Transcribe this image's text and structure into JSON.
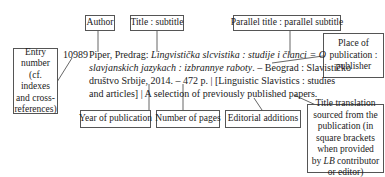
{
  "labels": {
    "author": "Author",
    "title_subtitle": "Title : subtitle",
    "parallel_title": "Parallel title : parallel subtitle",
    "entry_number": [
      "Entry",
      "number",
      "(cf. indexes",
      "and cross-",
      "references)"
    ],
    "place_publisher": [
      "Place of",
      "publication :",
      "publisher"
    ],
    "year": "Year of publication",
    "pages": "Number of pages",
    "editorial": "Editorial additions",
    "translation": [
      "Title translation",
      "sourced from the",
      "publication (in",
      "square brackets",
      "when provided",
      "by ",
      "LB",
      " contributor",
      "or editor)"
    ]
  },
  "entry": {
    "number": "10989",
    "line1_plain": "Piper, Predrag: ",
    "line1_italic": "Lingvistička slcvistika : studije i članci = O",
    "line2_italic": "slavjanskich jazykach : izbrannye raboty",
    "line2_plain": ". – Beograd : Slavističko",
    "line3": "društvo Srbije, 2014. – 472 p. | [Linguistic Slavistics : studies",
    "line4": "and articles] | A selection of previously published papers."
  }
}
